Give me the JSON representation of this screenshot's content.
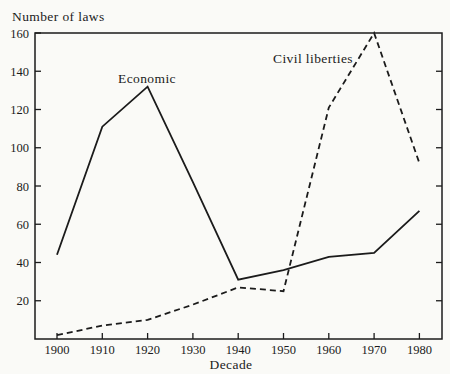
{
  "figure": {
    "background": "#fafaf7",
    "ink_color": "#1b1b1b"
  },
  "chart_data": {
    "type": "line",
    "title": "",
    "ylabel": "Number of laws",
    "xlabel": "Decade",
    "x": [
      "1900",
      "1910",
      "1920",
      "1930",
      "1940",
      "1950",
      "1960",
      "1970",
      "1980"
    ],
    "ylim": [
      0,
      160
    ],
    "yticks": [
      20,
      40,
      60,
      80,
      100,
      120,
      140,
      160
    ],
    "grid": false,
    "legend_position": "inline-annotations",
    "frame": "full-box-inward-ticks",
    "series": [
      {
        "name": "Economic",
        "line_style": "solid",
        "color": "#1b1b1b",
        "values": [
          44,
          111,
          132,
          82,
          31,
          36,
          43,
          45,
          67
        ]
      },
      {
        "name": "Civil liberties",
        "line_style": "dashed",
        "color": "#1b1b1b",
        "values": [
          2,
          7,
          10,
          18,
          27,
          25,
          121,
          160,
          92
        ]
      }
    ]
  }
}
